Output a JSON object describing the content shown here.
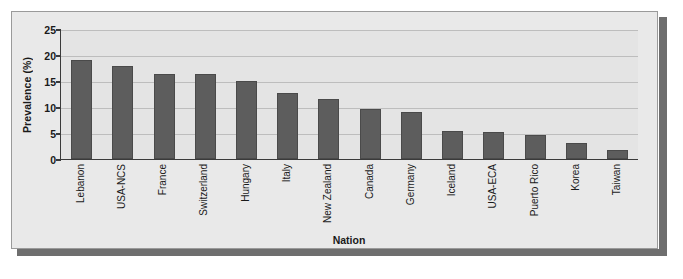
{
  "chart_data": {
    "type": "bar",
    "title": "",
    "xlabel": "Nation",
    "ylabel": "Prevalence (%)",
    "ylim": [
      0,
      25
    ],
    "yticks": [
      0,
      5,
      10,
      15,
      20,
      25
    ],
    "grid": true,
    "legend": "none",
    "bar_color": "#5d5d5d",
    "plot_background": "#e4e4e4",
    "panel_background": "#e9e9e9",
    "categories": [
      "Lebanon",
      "USA-NCS",
      "France",
      "Switzerland",
      "Hungary",
      "Italy",
      "New Zealand",
      "Canada",
      "Germany",
      "Iceland",
      "USA-ECA",
      "Puerto Rico",
      "Korea",
      "Taiwan"
    ],
    "values": [
      19.1,
      17.8,
      16.4,
      16.4,
      15.0,
      12.6,
      11.6,
      9.6,
      9.0,
      5.3,
      5.2,
      4.6,
      3.0,
      1.7
    ]
  }
}
